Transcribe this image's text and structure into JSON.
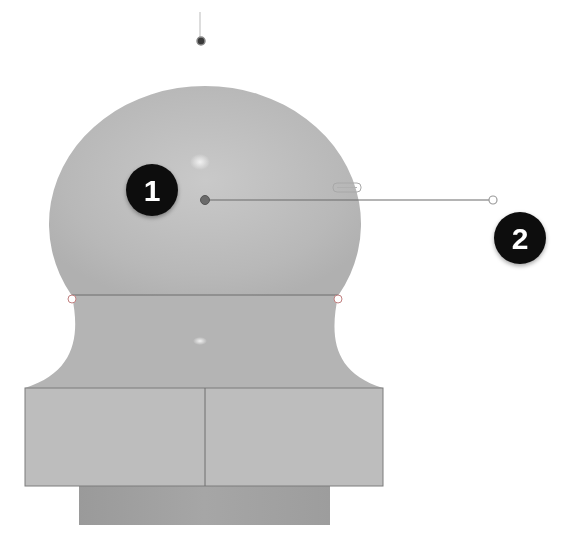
{
  "diagram": {
    "colors": {
      "background": "#ffffff",
      "body_fill": "#b9b9b9",
      "body_fill_light": "#c8c8c8",
      "base_fill": "#bdbdbd",
      "plinth_fill": "#9e9e9e",
      "edge_stroke": "#7a7a7a",
      "marker_fill": "#111111",
      "marker_text": "#ffffff",
      "leader_line": "#6a6a6a"
    },
    "callouts": [
      {
        "id": "1",
        "label": "1",
        "target": "sphere-center-point"
      },
      {
        "id": "2",
        "label": "2",
        "target": "leader-line-endpoint"
      }
    ]
  }
}
